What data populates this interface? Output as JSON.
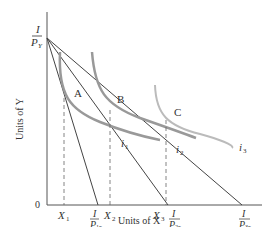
{
  "diagram": {
    "type": "indifference-curve-budget-lines",
    "axes": {
      "x_label": "Units of X",
      "y_label": "Units of Y",
      "origin_label": "0",
      "y_intercept": {
        "num": "I",
        "den": "P",
        "den_sub": "Y"
      }
    },
    "x_ticks": [
      {
        "label": "X",
        "sub": "1"
      },
      {
        "label": "X",
        "sub": "2"
      },
      {
        "label": "X",
        "sub": "3"
      }
    ],
    "x_intercepts": [
      {
        "num": "I",
        "den": "P",
        "den_sub": "1x"
      },
      {
        "num": "I",
        "den": "P",
        "den_sub": "2x"
      },
      {
        "num": "I",
        "den": "P",
        "den_sub": "3x"
      }
    ],
    "points": [
      "A",
      "B",
      "C"
    ],
    "curves": [
      {
        "label": "i",
        "sub": "1"
      },
      {
        "label": "i",
        "sub": "2"
      },
      {
        "label": "i",
        "sub": "3"
      }
    ],
    "colors": {
      "axis": "#555555",
      "budget_line": "#444444",
      "curve": "#999999",
      "curve_light": "#bbbbbb",
      "dashed": "#666666"
    }
  }
}
